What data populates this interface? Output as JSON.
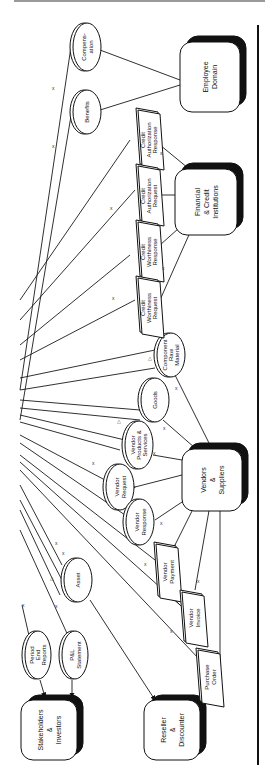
{
  "diagram": {
    "orientation": "rotated-90-ccw",
    "external_entities": [
      {
        "id": "employee",
        "label_lines": [
          "Employee",
          "Domain"
        ]
      },
      {
        "id": "financial",
        "label_lines": [
          "Financial",
          "& Credit",
          "Institutions"
        ]
      },
      {
        "id": "vendors",
        "label_lines": [
          "Vendors",
          "&",
          "Suppliers"
        ]
      },
      {
        "id": "stakeholders",
        "label_lines": [
          "Stakeholders",
          "&",
          "Investors"
        ]
      },
      {
        "id": "reseller",
        "label_lines": [
          "Reseller",
          "&",
          "Discounter"
        ]
      }
    ],
    "ellipses": [
      {
        "id": "compensation",
        "label_lines": [
          "Compens-",
          "ation"
        ]
      },
      {
        "id": "benefits",
        "label_lines": [
          "Benefits"
        ]
      },
      {
        "id": "component",
        "label_lines": [
          "Component",
          "Raw",
          "Material"
        ]
      },
      {
        "id": "goods",
        "label_lines": [
          "Goods"
        ]
      },
      {
        "id": "vendor-products",
        "label_lines": [
          "Vendor",
          "Products &",
          "Services"
        ]
      },
      {
        "id": "vendor-request",
        "label_lines": [
          "Vendor",
          "Request"
        ]
      },
      {
        "id": "vendor-response",
        "label_lines": [
          "Vendor",
          "Response"
        ]
      },
      {
        "id": "asset",
        "label_lines": [
          "Asset"
        ]
      },
      {
        "id": "period-end",
        "label_lines": [
          "Period",
          "End",
          "Reports"
        ]
      },
      {
        "id": "pl-statement",
        "label_lines": [
          "P&L",
          "Statement"
        ]
      }
    ],
    "documents": [
      {
        "id": "credit-auth-response",
        "label_lines": [
          "Credit",
          "Authorization",
          "Response"
        ]
      },
      {
        "id": "credit-auth-request",
        "label_lines": [
          "Credit",
          "Authorization",
          "Request"
        ]
      },
      {
        "id": "credit-worth-response",
        "label_lines": [
          "Credit",
          "Worthiness",
          "Response"
        ]
      },
      {
        "id": "credit-worth-request",
        "label_lines": [
          "Credit",
          "Worthiness",
          "Request"
        ]
      },
      {
        "id": "vendor-payment",
        "label_lines": [
          "Vendor",
          "Payment"
        ]
      },
      {
        "id": "vendor-invoice",
        "label_lines": [
          "Vendor",
          "Invoice"
        ]
      },
      {
        "id": "purchase-order",
        "label_lines": [
          "Purchase",
          "Order"
        ]
      }
    ],
    "markers": {
      "cross": "x",
      "triangle": "△"
    }
  }
}
